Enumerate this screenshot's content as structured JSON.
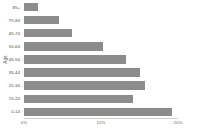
{
  "chart_data": {
    "type": "bar",
    "orientation": "horizontal",
    "title": "",
    "xlabel": "",
    "ylabel": "Age",
    "categories": [
      "85+",
      "75-84",
      "65-74",
      "55-64",
      "45-54",
      "35-44",
      "25-34",
      "15-24",
      "0-14"
    ],
    "values": [
      1.8,
      4.5,
      6.2,
      10.2,
      13.3,
      15.1,
      15.7,
      14.2,
      19.2
    ],
    "value_unit": "%",
    "xlim": [
      0,
      20.2
    ],
    "xticks": [
      0,
      10,
      20
    ],
    "xtick_labels": [
      "0%",
      "10%",
      "20%"
    ],
    "grid": false,
    "legend": null,
    "bar_color": "#8c8c8c",
    "axis_color": "#d0d0d0",
    "text_color": "#4d4d4d"
  }
}
